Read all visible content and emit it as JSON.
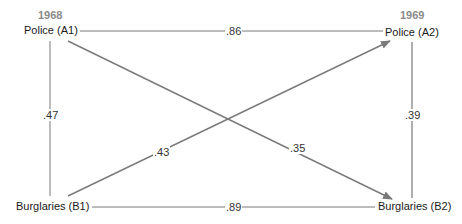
{
  "diagram": {
    "type": "cross-lagged-panel",
    "years": {
      "left": "1968",
      "right": "1969"
    },
    "nodes": {
      "A1": "Police (A1)",
      "A2": "Police (A2)",
      "B1": "Burglaries (B1)",
      "B2": "Burglaries (B2)"
    },
    "paths": {
      "A1_A2": ".86",
      "B1_B2": ".89",
      "A1_B1": ".47",
      "A2_B2": ".39",
      "B1_A2": ".43",
      "A1_B2": ".35"
    },
    "colors": {
      "line": "#7a7a7a",
      "year": "#8a8a8a",
      "text": "#1a1a1a"
    }
  }
}
